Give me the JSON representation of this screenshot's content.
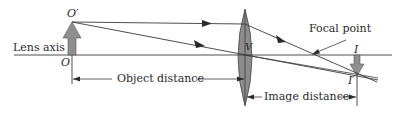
{
  "diagram": {
    "type": "thin-lens ray diagram",
    "labels": {
      "lens_axis": "Lens axis",
      "object_top": "O′",
      "object_base": "O",
      "lens_center": "V",
      "focal_point": "Focal point",
      "image_base": "I",
      "image_tip": "I′",
      "object_distance": "Object distance",
      "image_distance": "Image distance"
    },
    "colors": {
      "line": "#3a3a3a",
      "lens_fill": "#8c8c8c",
      "arrow_fill": "#8f8f8f",
      "text": "#2a2a2a",
      "background": "#ffffff"
    }
  }
}
